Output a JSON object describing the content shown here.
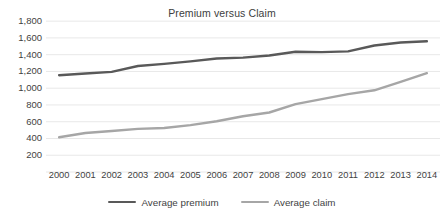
{
  "chart_data": {
    "type": "line",
    "title": "Premium versus Claim",
    "xlabel": "",
    "ylabel": "",
    "categories": [
      "2000",
      "2001",
      "2002",
      "2003",
      "2004",
      "2005",
      "2006",
      "2007",
      "2008",
      "2009",
      "2010",
      "2011",
      "2012",
      "2013",
      "2014"
    ],
    "yticks": [
      "200",
      "400",
      "600",
      "800",
      "1,000",
      "1,200",
      "1,400",
      "1,600",
      "1,800"
    ],
    "ytick_values": [
      200,
      400,
      600,
      800,
      1000,
      1200,
      1400,
      1600,
      1800
    ],
    "ylim": [
      0,
      1800
    ],
    "grid": true,
    "legend_position": "bottom",
    "series": [
      {
        "name": "Average premium",
        "color": "#595959",
        "values": [
          1155,
          1175,
          1195,
          1265,
          1290,
          1320,
          1355,
          1365,
          1390,
          1435,
          1430,
          1440,
          1510,
          1545,
          1560
        ]
      },
      {
        "name": "Average claim",
        "color": "#a6a6a6",
        "values": [
          415,
          465,
          490,
          515,
          525,
          560,
          605,
          665,
          710,
          810,
          870,
          930,
          975,
          1075,
          1180
        ]
      }
    ]
  },
  "legend": {
    "items": [
      {
        "label": "Average premium",
        "color": "#595959"
      },
      {
        "label": "Average claim",
        "color": "#a6a6a6"
      }
    ]
  },
  "colors": {
    "premium": "#595959",
    "claim": "#a6a6a6",
    "gridline": "#e8e8e8",
    "text": "#3f3f3f",
    "background": "#ffffff"
  }
}
